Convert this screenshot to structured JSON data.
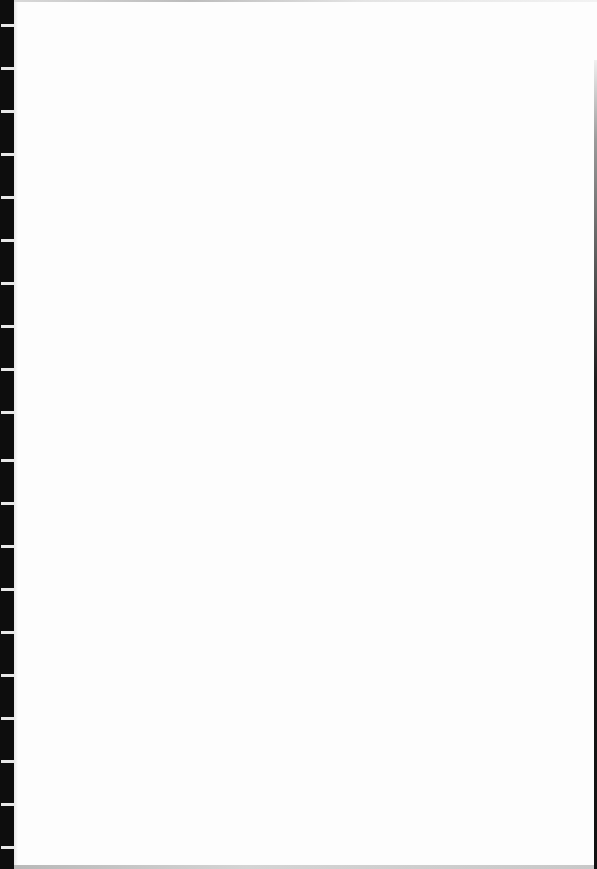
{
  "document": {
    "type": "scanned blank page",
    "text_content": "",
    "binding_strip": {
      "color": "#0d0d0d",
      "tick_color": "#e8e8e8",
      "tick_positions_y": [
        24,
        67,
        110,
        153,
        196,
        239,
        282,
        325,
        368,
        411,
        459,
        502,
        545,
        588,
        631,
        674,
        717,
        760,
        803,
        846
      ]
    },
    "page_background": "#fdfdfd"
  }
}
